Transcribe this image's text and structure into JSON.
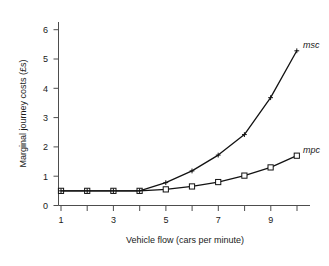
{
  "chart_data": {
    "type": "line",
    "title": "",
    "xlabel": "Vehicle flow (cars per minute)",
    "ylabel": "Marginal journey costs (£s)",
    "xlim": [
      0.4,
      10.6
    ],
    "ylim": [
      0,
      6.6
    ],
    "x": [
      1,
      2,
      3,
      4,
      5,
      6,
      7,
      8,
      9,
      10
    ],
    "xticks": [
      1,
      2,
      3,
      4,
      5,
      6,
      7,
      8,
      9,
      10
    ],
    "xtick_labels": [
      "1",
      "",
      "3",
      "",
      "5",
      "",
      "7",
      "",
      "9",
      ""
    ],
    "yticks": [
      0,
      1,
      2,
      3,
      4,
      5,
      6
    ],
    "ytick_labels": [
      "0",
      "1",
      "2",
      "3",
      "4",
      "5",
      "6"
    ],
    "grid": false,
    "legend_position": "inline-right",
    "series": [
      {
        "name": "mpc",
        "label": "mpc",
        "marker": "open-square",
        "color": "#121212",
        "values": [
          0.5,
          0.5,
          0.5,
          0.5,
          0.55,
          0.65,
          0.8,
          1.02,
          1.3,
          1.7
        ]
      },
      {
        "name": "msc",
        "label": "msc",
        "marker": "plus",
        "color": "#121212",
        "values": [
          0.5,
          0.5,
          0.5,
          0.5,
          0.78,
          1.18,
          1.72,
          2.42,
          3.68,
          5.28
        ]
      }
    ],
    "annotations": [
      {
        "text": "msc",
        "x": 10.2,
        "y": 5.95
      },
      {
        "text": "mpc",
        "x": 10.2,
        "y": 2.12
      }
    ]
  },
  "axes": {
    "y_title": "Marginal journey costs (£s)",
    "x_title": "Vehicle flow (cars per minute)",
    "y_labels": {
      "t0": "0",
      "t1": "1",
      "t2": "2",
      "t3": "3",
      "t4": "4",
      "t5": "5",
      "t6": "6"
    },
    "x_labels": {
      "t1": "1",
      "t3": "3",
      "t5": "5",
      "t7": "7",
      "t9": "9"
    }
  },
  "labels": {
    "msc": "msc",
    "mpc": "mpc"
  },
  "colors": {
    "curve": "#121212",
    "axis": "#4d4d4d",
    "background": "#ffffff",
    "text": "#1a1a1a"
  }
}
